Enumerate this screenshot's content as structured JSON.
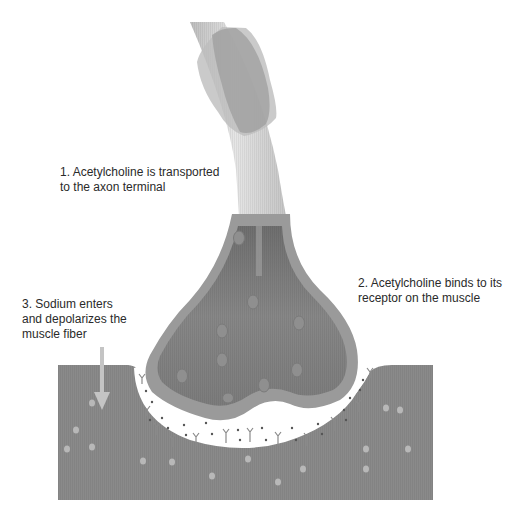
{
  "diagram": {
    "colors": {
      "background": "#ffffff",
      "muscle": "#8a8a8a",
      "axon_outer": "#c9c9c9",
      "axon_highlight": "#e4e4e4",
      "myelin": "#9e9e9e",
      "terminal_wall": "#9a9a9a",
      "terminal_fill": "#7f7f7f",
      "cleft": "#ffffff",
      "vesicle": "#8f8f8f",
      "arrow": "#c4c4c4",
      "text": "#2a2a2a"
    },
    "labels": [
      {
        "id": "step-1",
        "lines": [
          "1. Acetylcholine is transported",
          "to the axon terminal"
        ]
      },
      {
        "id": "step-2",
        "lines": [
          "2. Acetylcholine binds to its",
          "receptor on the muscle"
        ]
      },
      {
        "id": "step-3",
        "lines": [
          "3. Sodium enters",
          "and depolarizes the",
          "muscle fiber"
        ]
      }
    ],
    "components": {
      "axon": "axon",
      "myelin_sheath": "myelin sheath",
      "axon_terminal": "axon terminal",
      "synaptic_vesicles": "synaptic vesicles",
      "synaptic_cleft": "synaptic cleft",
      "receptors": "acetylcholine receptors",
      "muscle_fiber": "muscle fiber",
      "sodium_arrow": "sodium influx arrow"
    }
  }
}
